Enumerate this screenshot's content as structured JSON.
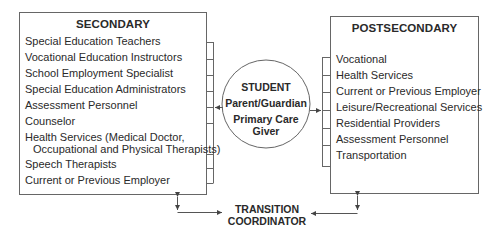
{
  "secondary": {
    "title": "SECONDARY",
    "items": [
      "Special Education Teachers",
      "Vocational Education Instructors",
      "School Employment Specialist",
      "Special Education Administrators",
      "Assessment Personnel",
      "Counselor",
      "Health Services (Medical Doctor,",
      "Occupational and Physical Therapists)",
      "Speech Therapists",
      "Current or Previous Employer"
    ]
  },
  "postsecondary": {
    "title": "POSTSECONDARY",
    "items": [
      "Vocational",
      "Health Services",
      "Current or Previous Employer",
      "Leisure/Recreational Services",
      "Residential Providers",
      "Assessment Personnel",
      "Transportation"
    ]
  },
  "center": {
    "line1": "STUDENT",
    "line2": "Parent/Guardian",
    "line3": "Primary Care",
    "line4": "Giver"
  },
  "coordinator": {
    "line1": "TRANSITION",
    "line2": "COORDINATOR"
  },
  "colors": {
    "line": "#555555",
    "text": "#2a2a2a"
  }
}
